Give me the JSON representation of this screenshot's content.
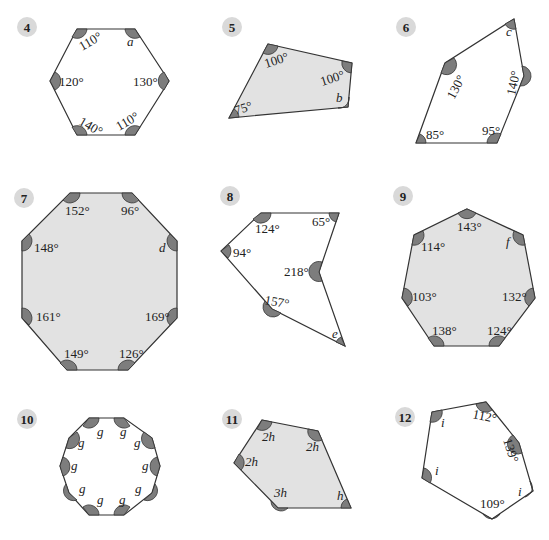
{
  "problems": [
    {
      "number": "4",
      "shape": "hexagon",
      "shaded": false,
      "angles": [
        "110°",
        "a",
        "120°",
        "130°",
        "140°",
        "110°"
      ]
    },
    {
      "number": "5",
      "shape": "quadrilateral",
      "shaded": true,
      "angles": [
        "100°",
        "100°",
        "b",
        "75°"
      ]
    },
    {
      "number": "6",
      "shape": "pentagon",
      "shaded": false,
      "angles": [
        "c",
        "130°",
        "140°",
        "85°",
        "95°"
      ]
    },
    {
      "number": "7",
      "shape": "octagon",
      "shaded": true,
      "angles": [
        "152°",
        "96°",
        "148°",
        "d",
        "161°",
        "169°",
        "149°",
        "126°"
      ]
    },
    {
      "number": "8",
      "shape": "concave hexagon",
      "shaded": false,
      "angles": [
        "124°",
        "65°",
        "94°",
        "218°",
        "157°",
        "e"
      ]
    },
    {
      "number": "9",
      "shape": "heptagon",
      "shaded": true,
      "angles": [
        "143°",
        "114°",
        "f",
        "103°",
        "132°",
        "138°",
        "124°"
      ]
    },
    {
      "number": "10",
      "shape": "decagon",
      "shaded": false,
      "angles": [
        "g",
        "g",
        "g",
        "g",
        "g",
        "g",
        "g",
        "g",
        "g",
        "g"
      ]
    },
    {
      "number": "11",
      "shape": "pentagon",
      "shaded": true,
      "angles": [
        "2h",
        "2h",
        "2h",
        "3h",
        "h"
      ]
    },
    {
      "number": "12",
      "shape": "hexagon",
      "shaded": false,
      "angles": [
        "i",
        "112°",
        "139°",
        "i",
        "i",
        "109°"
      ]
    }
  ],
  "colors": {
    "badge": "#d9d9d9",
    "shaded_fill": "#e2e2e2",
    "angle_marker": "#7d7d7d",
    "outline": "#333333"
  }
}
